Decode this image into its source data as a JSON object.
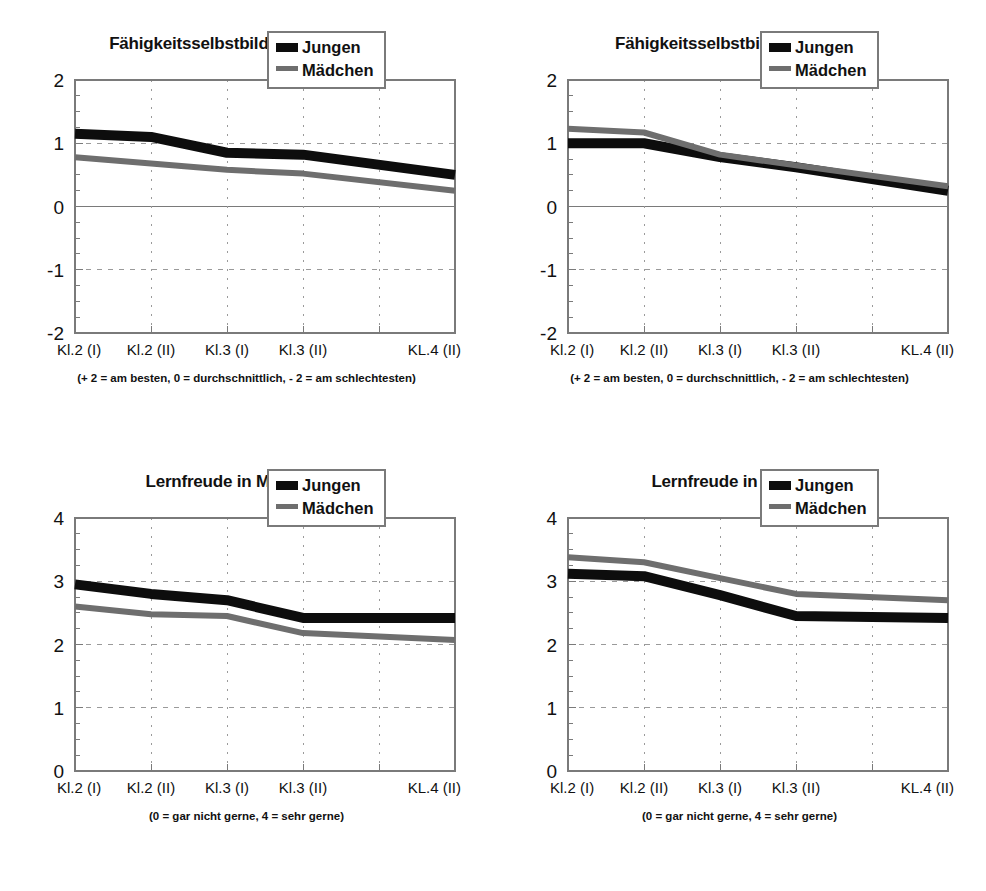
{
  "figure": {
    "background_color": "#ffffff",
    "series_colors": {
      "jungen": "#0d0d0d",
      "maedchen": "#6e6e6e"
    },
    "axis_color": "#7a7a7a",
    "grid_color": "#9a9a9a",
    "legend": {
      "jungen_label": "Jungen",
      "maedchen_label": "Mädchen"
    },
    "categories": [
      "Kl.2 (I)",
      "Kl.2 (II)",
      "Kl.3 (I)",
      "Kl.3 (II)",
      "KL.4 (II)"
    ]
  },
  "panels": {
    "top_left": {
      "title": "Fähigkeitsselbstbild in Mathematik",
      "footnote": "(+ 2 = am besten,  0 = durchschnittlich,  - 2 = am schlechtesten)",
      "ytick_labels": [
        "2",
        "1",
        "0",
        "-1",
        "-2"
      ]
    },
    "top_right": {
      "title": "Fähigkeitsselbstbild in Deutsch",
      "footnote": "(+ 2 = am besten,  0 = durchschnittlich, - 2 = am schlechtesten)",
      "ytick_labels": [
        "2",
        "1",
        "0",
        "-1",
        "-2"
      ]
    },
    "bottom_left": {
      "title": "Lernfreude in Mathematik",
      "footnote": "(0 = gar nicht gerne,  4 = sehr gerne)",
      "ytick_labels": [
        "4",
        "3",
        "2",
        "1",
        "0"
      ]
    },
    "bottom_right": {
      "title": "Lernfreude in Deutsch",
      "footnote": "(0 = gar nicht gerne,  4 = sehr gerne)",
      "ytick_labels": [
        "4",
        "3",
        "2",
        "1",
        "0"
      ]
    }
  },
  "chart_data": [
    {
      "id": "top_left",
      "type": "line",
      "title": "Fähigkeitsselbstbild in Mathematik",
      "subtitle": "(+ 2 = am besten,  0 = durchschnittlich,  - 2 = am schlechtesten)",
      "xlabel": "",
      "ylabel": "",
      "categories": [
        "Kl.2 (I)",
        "Kl.2 (II)",
        "Kl.3 (I)",
        "Kl.3 (II)",
        "KL.4 (II)"
      ],
      "ylim": [
        -2,
        2
      ],
      "yticks": [
        2,
        1,
        0,
        -1,
        -2
      ],
      "grid": true,
      "legend_position": "top-right",
      "series": [
        {
          "name": "Jungen",
          "values": [
            1.15,
            1.1,
            0.85,
            0.82,
            0.5
          ]
        },
        {
          "name": "Mädchen",
          "values": [
            0.78,
            0.68,
            0.58,
            0.52,
            0.25
          ]
        }
      ]
    },
    {
      "id": "top_right",
      "type": "line",
      "title": "Fähigkeitsselbstbild in Deutsch",
      "subtitle": "(+ 2 = am besten,  0 = durchschnittlich, - 2 = am schlechtesten)",
      "xlabel": "",
      "ylabel": "",
      "categories": [
        "Kl.2 (I)",
        "Kl.2 (II)",
        "Kl.3 (I)",
        "Kl.3 (II)",
        "KL.4 (II)"
      ],
      "ylim": [
        -2,
        2
      ],
      "yticks": [
        2,
        1,
        0,
        -1,
        -2
      ],
      "grid": true,
      "legend_position": "top-right",
      "series": [
        {
          "name": "Jungen",
          "values": [
            1.0,
            1.0,
            0.78,
            0.62,
            0.25
          ]
        },
        {
          "name": "Mädchen",
          "values": [
            1.23,
            1.17,
            0.82,
            0.65,
            0.32
          ]
        }
      ]
    },
    {
      "id": "bottom_left",
      "type": "line",
      "title": "Lernfreude in Mathematik",
      "subtitle": "(0 = gar nicht gerne,  4 = sehr gerne)",
      "xlabel": "",
      "ylabel": "",
      "categories": [
        "Kl.2 (I)",
        "Kl.2 (II)",
        "Kl.3 (I)",
        "Kl.3 (II)",
        "KL.4 (II)"
      ],
      "ylim": [
        0,
        4
      ],
      "yticks": [
        4,
        3,
        2,
        1,
        0
      ],
      "grid": true,
      "legend_position": "top-right",
      "series": [
        {
          "name": "Jungen",
          "values": [
            2.95,
            2.8,
            2.7,
            2.42,
            2.42
          ]
        },
        {
          "name": "Mädchen",
          "values": [
            2.6,
            2.48,
            2.45,
            2.18,
            2.07
          ]
        }
      ]
    },
    {
      "id": "bottom_right",
      "type": "line",
      "title": "Lernfreude in Deutsch",
      "subtitle": "(0 = gar nicht gerne,  4 = sehr gerne)",
      "xlabel": "",
      "ylabel": "",
      "categories": [
        "Kl.2 (I)",
        "Kl.2 (II)",
        "Kl.3 (I)",
        "Kl.3 (II)",
        "KL.4 (II)"
      ],
      "ylim": [
        0,
        4
      ],
      "yticks": [
        4,
        3,
        2,
        1,
        0
      ],
      "grid": true,
      "legend_position": "top-right",
      "series": [
        {
          "name": "Jungen",
          "values": [
            3.12,
            3.08,
            2.78,
            2.45,
            2.42
          ]
        },
        {
          "name": "Mädchen",
          "values": [
            3.38,
            3.3,
            3.05,
            2.8,
            2.7
          ]
        }
      ]
    }
  ]
}
